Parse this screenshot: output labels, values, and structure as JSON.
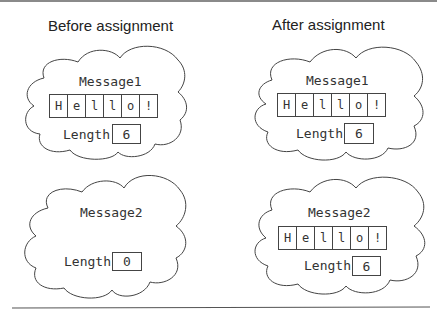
{
  "headings": {
    "before": "Before assignment",
    "after": "After assignment"
  },
  "panels": {
    "before": {
      "message1": {
        "name": "Message1",
        "chars": [
          "H",
          "e",
          "l",
          "l",
          "o",
          "!"
        ],
        "length_label": "Length",
        "length_value": "6"
      },
      "message2": {
        "name": "Message2",
        "chars": [],
        "length_label": "Length",
        "length_value": "0"
      }
    },
    "after": {
      "message1": {
        "name": "Message1",
        "chars": [
          "H",
          "e",
          "l",
          "l",
          "o",
          "!"
        ],
        "length_label": "Length",
        "length_value": "6"
      },
      "message2": {
        "name": "Message2",
        "chars": [
          "H",
          "e",
          "l",
          "l",
          "o",
          "!"
        ],
        "length_label": "Length",
        "length_value": "6"
      }
    }
  }
}
